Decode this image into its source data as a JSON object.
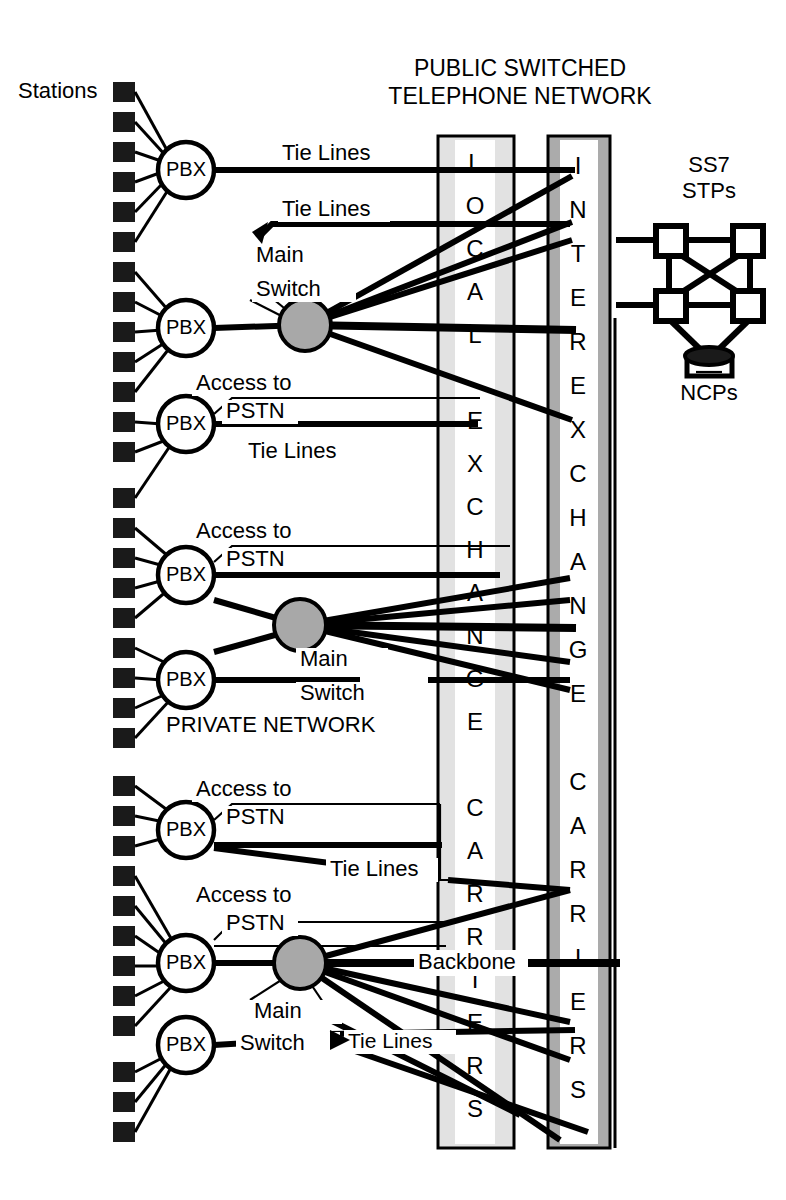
{
  "diagram": {
    "title_line1": "PUBLIC SWITCHED",
    "title_line2": "TELEPHONE NETWORK",
    "stations_label": "Stations",
    "private_network_label": "PRIVATE NETWORK",
    "backbone_label": "Backbone",
    "ss7_label_line1": "SS7",
    "ss7_label_line2": "STPs",
    "ncp_label": "NCPs",
    "local_exchange_text": "LOCAL EXCHANGE CARRIERS",
    "interexchange_text": "INTEREXCHANGE CARRIERS",
    "local_exchange_letters": [
      "L",
      "O",
      "C",
      "A",
      "L",
      "",
      "E",
      "X",
      "C",
      "H",
      "A",
      "N",
      "G",
      "E",
      "",
      "C",
      "A",
      "R",
      "R",
      "I",
      "E",
      "R",
      "S"
    ],
    "interexchange_letters": [
      "I",
      "N",
      "T",
      "E",
      "R",
      "E",
      "X",
      "C",
      "H",
      "A",
      "N",
      "G",
      "E",
      "",
      "C",
      "A",
      "R",
      "R",
      "I",
      "E",
      "R",
      "S"
    ],
    "pbx_label": "PBX",
    "main_switch_line1": "Main",
    "main_switch_line2": "Switch",
    "tie_lines_label": "Tie Lines",
    "access_line1": "Access to",
    "access_line2": "PSTN",
    "colors": {
      "local_exchange_fill": "#e2e2e2",
      "interexchange_fill": "#ababab",
      "main_switch_fill": "#a8a8a8",
      "line": "#000000",
      "station": "#1a1a1a",
      "background": "#ffffff"
    },
    "nodes": {
      "pbx_count": 7,
      "main_switch_count": 3,
      "stp_count": 4,
      "ncp_count": 1
    },
    "annotations": [
      {
        "id": "tie-1",
        "text": "Tie Lines"
      },
      {
        "id": "tie-2",
        "text": "Tie Lines"
      },
      {
        "id": "main-switch-1",
        "text": "Main Switch"
      },
      {
        "id": "access-1",
        "text": "Access to PSTN"
      },
      {
        "id": "tie-3",
        "text": "Tie Lines"
      },
      {
        "id": "access-2",
        "text": "Access to PSTN"
      },
      {
        "id": "main-switch-2",
        "text": "Main Switch"
      },
      {
        "id": "private-network",
        "text": "PRIVATE NETWORK"
      },
      {
        "id": "access-3",
        "text": "Access to PSTN"
      },
      {
        "id": "tie-4",
        "text": "Tie Lines"
      },
      {
        "id": "access-4",
        "text": "Access to PSTN"
      },
      {
        "id": "backbone",
        "text": "Backbone"
      },
      {
        "id": "main-switch-3",
        "text": "Main Switch"
      },
      {
        "id": "tie-5",
        "text": "Tie Lines"
      }
    ]
  }
}
